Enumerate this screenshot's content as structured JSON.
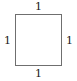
{
  "figure": {
    "name": "square-with-side-labels",
    "background_color": "#ffffff",
    "shape": {
      "type": "square",
      "stroke_color": "#6f6f6f",
      "fill_color": "#ffffff",
      "stroke_width_px": 1
    },
    "labels": {
      "top": "1",
      "right": "1",
      "bottom": "1",
      "left": "1"
    },
    "text_color": "#1a1a1a"
  },
  "chart_data": {
    "type": "diagram",
    "shape": "square",
    "title": "",
    "sides": [
      {
        "position": "top",
        "label": "1",
        "value": 1
      },
      {
        "position": "right",
        "label": "1",
        "value": 1
      },
      {
        "position": "bottom",
        "label": "1",
        "value": 1
      },
      {
        "position": "left",
        "label": "1",
        "value": 1
      }
    ],
    "units": "",
    "annotations": [
      "1",
      "1",
      "1",
      "1"
    ]
  }
}
